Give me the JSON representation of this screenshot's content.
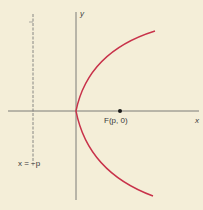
{
  "diagram": {
    "title": "",
    "colors": {
      "background": "#f4eed8",
      "axes": "#6e6e6e",
      "curve": "#c8324a",
      "directrix": "#7a7a7a",
      "focus": "#1a1a1a"
    },
    "labels": {
      "x_axis": "x",
      "y_axis": "y",
      "focus": "F(p, 0)",
      "directrix": "x = −p"
    },
    "elements": {
      "curve": "parabola y² = 4px opening right, vertex at origin",
      "focus_point": "F(p, 0)",
      "directrix_line": "x = −p (dashed vertical line)"
    }
  }
}
